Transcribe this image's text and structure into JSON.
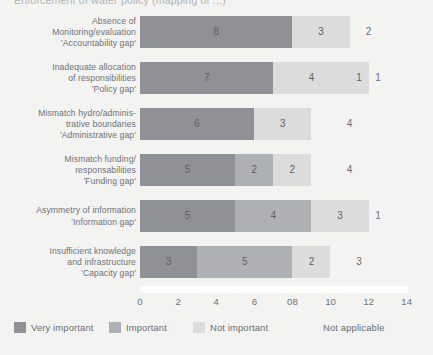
{
  "title_clipped": "Enforcement of water policy (mapping of ...)",
  "chart_data": {
    "type": "bar",
    "orientation": "horizontal",
    "stacked": true,
    "title": "",
    "xlabel": "",
    "ylabel": "",
    "xlim": [
      0,
      14
    ],
    "xticks": [
      "0",
      "2",
      "4",
      "6",
      "08",
      "10",
      "12",
      "14"
    ],
    "xtick_values": [
      0,
      2,
      4,
      6,
      8,
      10,
      12,
      14
    ],
    "grid": false,
    "legend_position": "bottom",
    "categories": [
      "Absence of Monitoring/evaluation 'Accountability gap'",
      "Inadequate allocation of responsibilities 'Policy gap'",
      "Mismatch hydro/administrative boundaries 'Administrative gap'",
      "Mismatch funding/responsabilities 'Funding gap'",
      "Asymmetry of information 'Information gap'",
      "Insufficient knowledge and infrastructure 'Capacity gap'"
    ],
    "series": [
      {
        "name": "Very important",
        "values": [
          8,
          7,
          6,
          5,
          5,
          3
        ]
      },
      {
        "name": "Important",
        "values": [
          0,
          0,
          0,
          2,
          4,
          5
        ]
      },
      {
        "name": "Not important",
        "values": [
          3,
          4,
          3,
          2,
          3,
          2
        ]
      },
      {
        "name": "Not applicable",
        "values": [
          2,
          1,
          4,
          4,
          1,
          3
        ]
      }
    ]
  },
  "rows": [
    {
      "label_lines": [
        "Absence of",
        "Monitoring/evaluation",
        "'Accountability gap'"
      ],
      "segments": [
        {
          "series": "Very important",
          "value": 8,
          "label": "8",
          "style": "s0"
        },
        {
          "series": "Not important",
          "value": 3,
          "label": "3",
          "style": "s2"
        },
        {
          "series": "Not applicable",
          "value": 2,
          "label": "2",
          "style": "s3"
        }
      ]
    },
    {
      "label_lines": [
        "Inadequate allocation",
        "of responsibilities",
        "'Policy gap'"
      ],
      "segments": [
        {
          "series": "Very important",
          "value": 7,
          "label": "7",
          "style": "s0"
        },
        {
          "series": "Not important",
          "value": 4,
          "label": "4",
          "style": "s2"
        },
        {
          "series": "Not important",
          "value": 1,
          "label": "1",
          "style": "s2"
        },
        {
          "series": "Not applicable",
          "value": 1,
          "label": "1",
          "style": "s3"
        }
      ]
    },
    {
      "label_lines": [
        "Mismatch hydro/adminis-",
        "trative boundaries",
        "'Administrative gap'"
      ],
      "segments": [
        {
          "series": "Very important",
          "value": 6,
          "label": "6",
          "style": "s0"
        },
        {
          "series": "Not important",
          "value": 3,
          "label": "3",
          "style": "s2"
        },
        {
          "series": "Not applicable",
          "value": 4,
          "label": "4",
          "style": "s3"
        }
      ]
    },
    {
      "label_lines": [
        "Mismatch funding/",
        "responsabilities",
        "'Funding gap'"
      ],
      "segments": [
        {
          "series": "Very important",
          "value": 5,
          "label": "5",
          "style": "s0"
        },
        {
          "series": "Important",
          "value": 2,
          "label": "2",
          "style": "s1"
        },
        {
          "series": "Not important",
          "value": 2,
          "label": "2",
          "style": "s2"
        },
        {
          "series": "Not applicable",
          "value": 4,
          "label": "4",
          "style": "s3"
        }
      ]
    },
    {
      "label_lines": [
        "Asymmetry of information",
        "'Information gap'"
      ],
      "segments": [
        {
          "series": "Very important",
          "value": 5,
          "label": "5",
          "style": "s0"
        },
        {
          "series": "Important",
          "value": 4,
          "label": "4",
          "style": "s1"
        },
        {
          "series": "Not important",
          "value": 3,
          "label": "3",
          "style": "s2"
        },
        {
          "series": "Not applicable",
          "value": 1,
          "label": "1",
          "style": "s3"
        }
      ]
    },
    {
      "label_lines": [
        "Insufficient knowledge",
        "and infrastructure",
        "'Capacity gap'"
      ],
      "segments": [
        {
          "series": "Very important",
          "value": 3,
          "label": "3",
          "style": "s0"
        },
        {
          "series": "Important",
          "value": 5,
          "label": "5",
          "style": "s1"
        },
        {
          "series": "Not important",
          "value": 2,
          "label": "2",
          "style": "s2"
        },
        {
          "series": "Not applicable",
          "value": 3,
          "label": "3",
          "style": "s3"
        }
      ]
    }
  ],
  "legend": [
    {
      "label": "Very important",
      "style": "l0",
      "color": "#8f9196",
      "x": 14
    },
    {
      "label": "Important",
      "style": "l1",
      "color": "#aeb0b4",
      "x": 109
    },
    {
      "label": "Not important",
      "style": "l2",
      "color": "#dcdcdc",
      "x": 193
    },
    {
      "label": "Not applicable",
      "style": "l3",
      "color": "#ffffff",
      "x": 306
    }
  ]
}
